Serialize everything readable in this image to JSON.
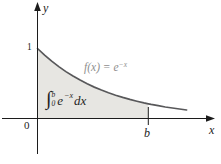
{
  "chart_data": {
    "type": "area",
    "title": "",
    "function": "f(x) = e^(-x)",
    "xlabel": "x",
    "ylabel": "y",
    "x": [
      0,
      0.1,
      0.2,
      0.3,
      0.4,
      0.5,
      0.6,
      0.7,
      0.8,
      0.9,
      1.0,
      1.1,
      1.2,
      1.3,
      1.4,
      1.5,
      1.56,
      1.6,
      1.7,
      1.8,
      1.9,
      2.0,
      2.1
    ],
    "y": [
      1.0,
      0.905,
      0.819,
      0.741,
      0.67,
      0.607,
      0.549,
      0.497,
      0.449,
      0.407,
      0.368,
      0.333,
      0.301,
      0.273,
      0.247,
      0.223,
      0.21,
      0.202,
      0.183,
      0.165,
      0.15,
      0.135,
      0.122
    ],
    "shade_from": 0,
    "shade_to": 1.56,
    "x_ticks": [
      {
        "value": 0,
        "label": "0"
      },
      {
        "value": 1.56,
        "label": "b"
      }
    ],
    "y_ticks": [
      {
        "value": 1,
        "label": "1"
      }
    ],
    "xlim": [
      -0.5,
      2.5
    ],
    "ylim": [
      -0.55,
      1.65
    ],
    "grid": false,
    "legend": "none",
    "annotations": [
      {
        "text": "f(x) = e⁻ˣ",
        "position": "above-curve"
      },
      {
        "text": "∫₀ᵇ e⁻ˣ dx",
        "position": "inside-shaded-region"
      }
    ]
  },
  "figure": {
    "axes": {
      "x_label": "x",
      "y_label": "y",
      "origin_label": "0",
      "one_label": "1",
      "b_label": "b",
      "color": "#1c1c1c"
    },
    "curve": {
      "color": "#58585a",
      "label": {
        "base": "f(x) = e",
        "exponent": "−x",
        "color": "#8e8e8e"
      }
    },
    "region": {
      "fill": "#e7e6e2"
    },
    "integral": {
      "sign": "∫",
      "upper": "b",
      "lower": "0",
      "base": "e",
      "exponent": "−x",
      "differential": "dx",
      "color": "#1f1f1f"
    }
  }
}
